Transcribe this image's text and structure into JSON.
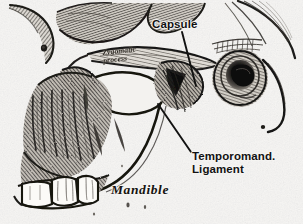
{
  "figure": {
    "style": "grayscale halftone engraving",
    "background_color": "#f4f3f1",
    "ink_color": "#1a1a1a"
  },
  "labels": {
    "capsule": {
      "text": "Capsule",
      "color": "#121212"
    },
    "temporomandibular_ligament": {
      "line1": "Temporomand.",
      "line2": "Ligament",
      "color": "#121212"
    },
    "mandible": {
      "text": "Mandible",
      "color": "#15130f"
    },
    "zygomatic_process": {
      "line1": "Zygomatic",
      "line2": "process",
      "color": "#1b1712"
    }
  },
  "structures": [
    {
      "name": "cranial-vault-arc",
      "description": "upper-left curved skull outline fragment"
    },
    {
      "name": "temporal-squama",
      "description": "hatched curved temporal bone plate, upper right"
    },
    {
      "name": "zygomatic-arch",
      "description": "horizontal bony arch across upper middle"
    },
    {
      "name": "mandibular-condyle",
      "description": "rounded condylar head beneath the arch"
    },
    {
      "name": "joint-capsule",
      "description": "dark fibrous capsule mass right of condyle"
    },
    {
      "name": "external-auditory-meatus",
      "description": "dark oval ear canal opening, right"
    },
    {
      "name": "mandibular-notch",
      "description": "light oval void between condyle and coronoid"
    },
    {
      "name": "coronoid-process",
      "description": "pointed process left of the notch"
    },
    {
      "name": "mandibular-ramus",
      "description": "broad vertical ramus body"
    },
    {
      "name": "mandibular-body",
      "description": "lower horizontal jaw body"
    },
    {
      "name": "molar-teeth",
      "description": "three molar crowns at lower left"
    },
    {
      "name": "stylomandibular-strand",
      "description": "thin ligament strand descending right"
    }
  ]
}
